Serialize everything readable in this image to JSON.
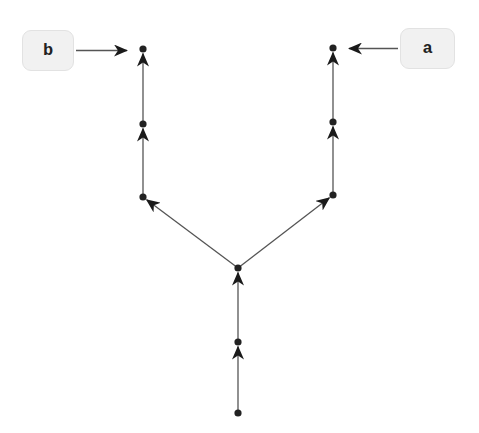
{
  "diagram": {
    "type": "directed-graph",
    "colors": {
      "edge": "#555555",
      "node": "#222222",
      "label_bg": "#f1f1f1",
      "label_border": "#e2e2e2"
    },
    "nodes": [
      {
        "id": "n0",
        "x": 238,
        "y": 413
      },
      {
        "id": "n1",
        "x": 238,
        "y": 342
      },
      {
        "id": "n2",
        "x": 238,
        "y": 268
      },
      {
        "id": "n3",
        "x": 143,
        "y": 197
      },
      {
        "id": "n4",
        "x": 143,
        "y": 124
      },
      {
        "id": "n5",
        "x": 143,
        "y": 49
      },
      {
        "id": "n6",
        "x": 333,
        "y": 195
      },
      {
        "id": "n7",
        "x": 333,
        "y": 122
      },
      {
        "id": "n8",
        "x": 333,
        "y": 48
      }
    ],
    "edges": [
      {
        "from": "n0",
        "to": "n1"
      },
      {
        "from": "n1",
        "to": "n2"
      },
      {
        "from": "n2",
        "to": "n3"
      },
      {
        "from": "n3",
        "to": "n4"
      },
      {
        "from": "n4",
        "to": "n5"
      },
      {
        "from": "n2",
        "to": "n6"
      },
      {
        "from": "n6",
        "to": "n7"
      },
      {
        "from": "n7",
        "to": "n8"
      }
    ],
    "labels": [
      {
        "id": "label_b",
        "text": "b",
        "points_to": "n5",
        "box": {
          "x": 22,
          "y": 30,
          "w": 52,
          "h": 41
        }
      },
      {
        "id": "label_a",
        "text": "a",
        "points_to": "n8",
        "box": {
          "x": 400,
          "y": 28,
          "w": 55,
          "h": 41
        }
      }
    ]
  }
}
